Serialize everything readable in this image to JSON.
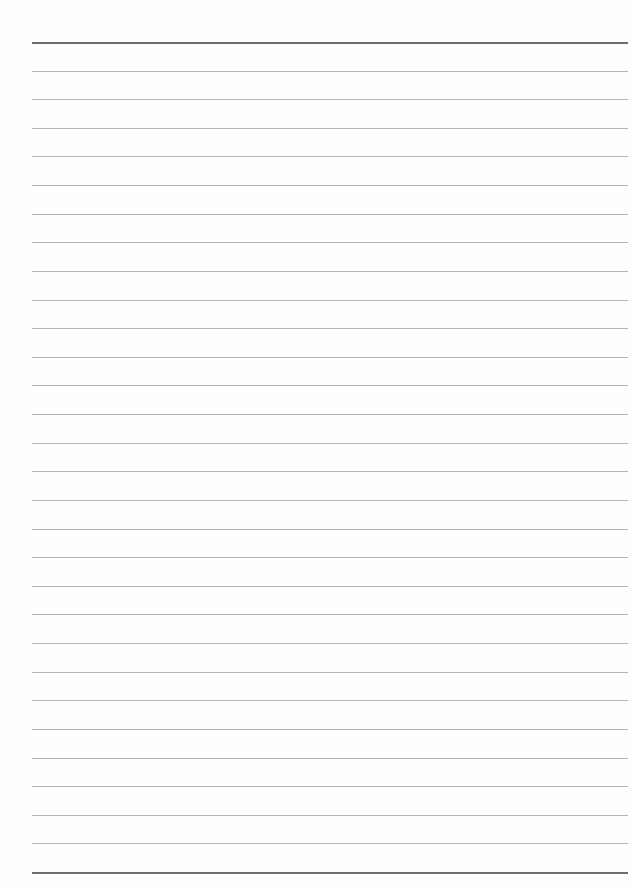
{
  "page": {
    "type": "lined-paper",
    "background": "#fefefe",
    "rule_count": 30,
    "first_rule_y": 42,
    "rule_spacing": 28.62,
    "rule_left": 32,
    "rule_width": 596,
    "light_rule_color": "#b4b4b4",
    "heavy_rule_color": "#6e6e6e",
    "heavy_rules": [
      0,
      29
    ]
  }
}
